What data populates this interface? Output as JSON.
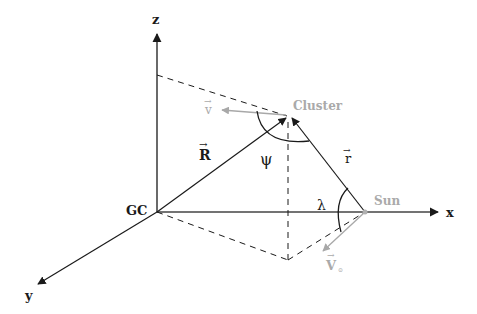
{
  "diagram": {
    "colors": {
      "line": "#1a1a1a",
      "axis": "#444444",
      "gray_label": "#aaaaaa",
      "gray_vector": "#a8a8a8"
    },
    "points": {
      "origin": {
        "label": "GC",
        "x": 157,
        "y": 212
      },
      "cluster": {
        "label": "Cluster",
        "x": 289,
        "y": 116
      },
      "sun": {
        "label": "Sun",
        "x": 365,
        "y": 212
      },
      "projection": {
        "x": 288,
        "y": 260
      },
      "z_proj": {
        "x": 157,
        "y": 75
      }
    },
    "axes": {
      "x": {
        "label": "x"
      },
      "y": {
        "label": "y"
      },
      "z": {
        "label": "z"
      }
    },
    "vectors": {
      "R": {
        "label": "R",
        "arrow": "→"
      },
      "r": {
        "label": "r",
        "arrow": "→"
      },
      "v": {
        "label": "v",
        "arrow": "→"
      },
      "V0": {
        "label": "V",
        "sub": "⊙",
        "arrow": "→"
      }
    },
    "angles": {
      "psi": {
        "label": "ψ"
      },
      "lambda": {
        "label": "λ"
      }
    }
  }
}
